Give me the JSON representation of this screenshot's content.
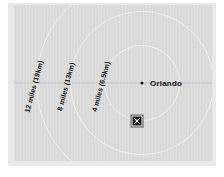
{
  "figure": {
    "name": "orlando-distance-ring-map",
    "background_color": "#ffffff",
    "frame_color": "#e9e9e9",
    "map_color": "#d9d9d9"
  },
  "map": {
    "center_label": "Orlando",
    "center_dot_color": "#1a1a1a",
    "ring_color": "#f0f0f0",
    "center_line_color": "#c6c6c6",
    "rings": [
      {
        "label": "4 miles (6.5km)",
        "miles": 4,
        "km": 6.5,
        "radius_px": 38
      },
      {
        "label": "8 miles (13km)",
        "miles": 8,
        "km": 13,
        "radius_px": 72
      },
      {
        "label": "12 miles (19km)",
        "miles": 12,
        "km": 19,
        "radius_px": 106
      }
    ],
    "site_marker": {
      "name": "site-marker",
      "icon": "x-mark-icon",
      "fill_color": "#1b1b1b"
    }
  }
}
